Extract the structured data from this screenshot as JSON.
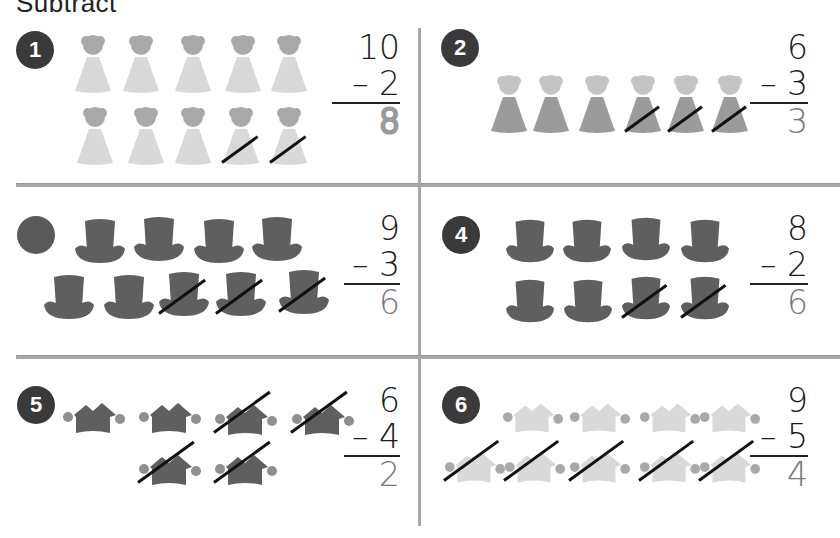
{
  "title": "Subtract",
  "colors": {
    "badge": "#3a3a3a",
    "divider": "#a8a8a8",
    "answer": "#777777",
    "strike": "#111111"
  },
  "problems": [
    {
      "number": "1",
      "item": "party-hat",
      "item_color": "light-gray",
      "total": 10,
      "crossed": 2,
      "minuend": "10",
      "subtrahend": "– 2",
      "answer": "8",
      "answer_style": "dashed"
    },
    {
      "number": "2",
      "item": "party-hat",
      "item_color": "medium-gray",
      "total": 6,
      "crossed": 3,
      "minuend": "6",
      "subtrahend": "– 3",
      "answer": "3",
      "answer_style": "filled"
    },
    {
      "number": "3",
      "item": "top-hat",
      "item_color": "dark-gray",
      "total": 9,
      "crossed": 3,
      "minuend": "9",
      "subtrahend": "– 3",
      "answer": "6",
      "answer_style": "filled"
    },
    {
      "number": "4",
      "item": "top-hat",
      "item_color": "dark-gray",
      "total": 8,
      "crossed": 2,
      "minuend": "8",
      "subtrahend": "– 2",
      "answer": "6",
      "answer_style": "filled"
    },
    {
      "number": "5",
      "item": "jester-hat",
      "item_color": "dark-gray",
      "total": 6,
      "crossed": 4,
      "minuend": "6",
      "subtrahend": "– 4",
      "answer": "2",
      "answer_style": "filled"
    },
    {
      "number": "6",
      "item": "jester-hat",
      "item_color": "light-gray",
      "total": 9,
      "crossed": 5,
      "minuend": "9",
      "subtrahend": "– 5",
      "answer": "4",
      "answer_style": "filled"
    }
  ]
}
